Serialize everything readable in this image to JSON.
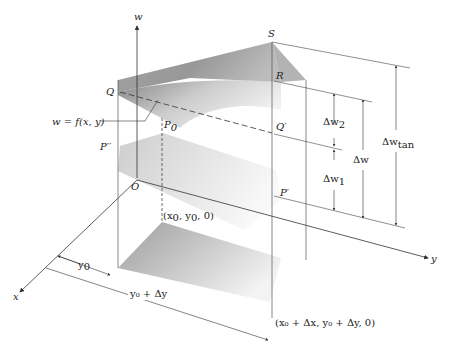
{
  "figure": {
    "type": "3d-surface-diagram",
    "colors": {
      "line": "#333333",
      "surface_dark": "#8a8a8a",
      "surface_light": "#e6e6e6",
      "background": "#ffffff"
    }
  },
  "axes": {
    "w": "w",
    "x": "x",
    "y": "y",
    "origin": "O"
  },
  "points": {
    "S": "S",
    "R": "R",
    "Q": "Q",
    "Q_prime": "Q′",
    "P0": "P",
    "P0_sub": "0",
    "P_double_prime": "P′′",
    "P_prime": "P′"
  },
  "labels": {
    "surface": "w = f(x, y)",
    "base_point": "(x",
    "base_point_sub": "0",
    "base_point_mid": ", y",
    "base_point_sub2": "0",
    "base_point_end": ", 0)",
    "far_point": "(x₀ + Δx, y₀ + Δy, 0)",
    "y0": "y",
    "y0_sub": "0",
    "y0_plus_dy": "y₀ + Δy"
  },
  "dimensions": {
    "dw2": "Δw",
    "dw2_sub": "2",
    "dw1": "Δw",
    "dw1_sub": "1",
    "dw": "Δw",
    "dw_tan": "Δw",
    "dw_tan_sub": "tan"
  }
}
